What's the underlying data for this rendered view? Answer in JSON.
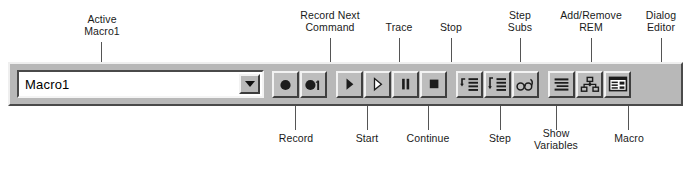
{
  "annotations_top": [
    {
      "id": "active-macro",
      "text": "Active\nMacro1"
    },
    {
      "id": "record-next-command",
      "text": "Record Next\nCommand"
    },
    {
      "id": "trace",
      "text": "Trace"
    },
    {
      "id": "stop",
      "text": "Stop"
    },
    {
      "id": "step-subs",
      "text": "Step\nSubs"
    },
    {
      "id": "add-remove-rem",
      "text": "Add/Remove\nREM"
    },
    {
      "id": "dialog-editor",
      "text": "Dialog\nEditor"
    }
  ],
  "annotations_bottom": [
    {
      "id": "record",
      "text": "Record"
    },
    {
      "id": "start",
      "text": "Start"
    },
    {
      "id": "continue",
      "text": "Continue"
    },
    {
      "id": "step",
      "text": "Step"
    },
    {
      "id": "show-variables",
      "text": "Show\nVariables"
    },
    {
      "id": "macro",
      "text": "Macro"
    }
  ],
  "toolbar": {
    "combo": {
      "value": "Macro1",
      "arrow_icon": "chevron-down-icon"
    },
    "groups": [
      {
        "name": "record-group",
        "buttons": [
          {
            "id": "record",
            "icon": "record-circle-icon",
            "tooltip": "Record"
          },
          {
            "id": "record-next-command",
            "icon": "record-one-icon",
            "tooltip": "Record Next Command"
          }
        ]
      },
      {
        "name": "run-group",
        "buttons": [
          {
            "id": "start",
            "icon": "play-triangle-icon",
            "tooltip": "Start"
          },
          {
            "id": "trace",
            "icon": "play-outline-triangle-icon",
            "tooltip": "Trace"
          },
          {
            "id": "continue",
            "icon": "pause-bars-icon",
            "tooltip": "Continue"
          },
          {
            "id": "stop",
            "icon": "stop-square-icon",
            "tooltip": "Stop"
          }
        ]
      },
      {
        "name": "step-group",
        "buttons": [
          {
            "id": "step",
            "icon": "step-into-lines-icon",
            "tooltip": "Step"
          },
          {
            "id": "step-subs",
            "icon": "step-subs-lines-icon",
            "tooltip": "Step Subs"
          },
          {
            "id": "show-variables",
            "icon": "glasses-icon",
            "tooltip": "Show Variables"
          }
        ]
      },
      {
        "name": "edit-group",
        "buttons": [
          {
            "id": "add-remove-rem",
            "icon": "comment-lines-icon",
            "tooltip": "Add/Remove REM"
          },
          {
            "id": "macro",
            "icon": "org-chart-icon",
            "tooltip": "Macro"
          },
          {
            "id": "dialog-editor",
            "icon": "dialog-box-icon",
            "tooltip": "Dialog Editor"
          }
        ]
      }
    ]
  },
  "colors": {
    "toolbar_face": "#b8b8b8",
    "button_face": "#bdbdbd",
    "highlight": "#f2f2f2",
    "shadow": "#3f3f3f",
    "glyph": "#1c1c1c",
    "leader_line": "#555555",
    "text": "#1a1a1a",
    "page_background": "#ffffff"
  }
}
